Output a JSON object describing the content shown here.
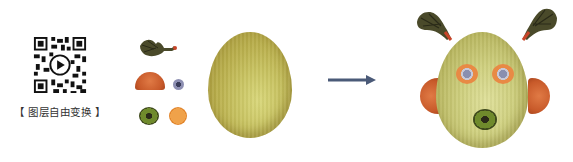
{
  "caption": "【 图层自由变换 】",
  "qr_code": {
    "label": "qr-code-with-play-icon"
  },
  "parts": [
    {
      "name": "hair-tuft"
    },
    {
      "name": "ear-slice"
    },
    {
      "name": "eyeball"
    },
    {
      "name": "kiwi-slice"
    },
    {
      "name": "orange-slice"
    },
    {
      "name": "melon"
    }
  ],
  "arrow": {
    "color": "#4a5a78"
  },
  "result": {
    "name": "fruit-face-composite"
  }
}
